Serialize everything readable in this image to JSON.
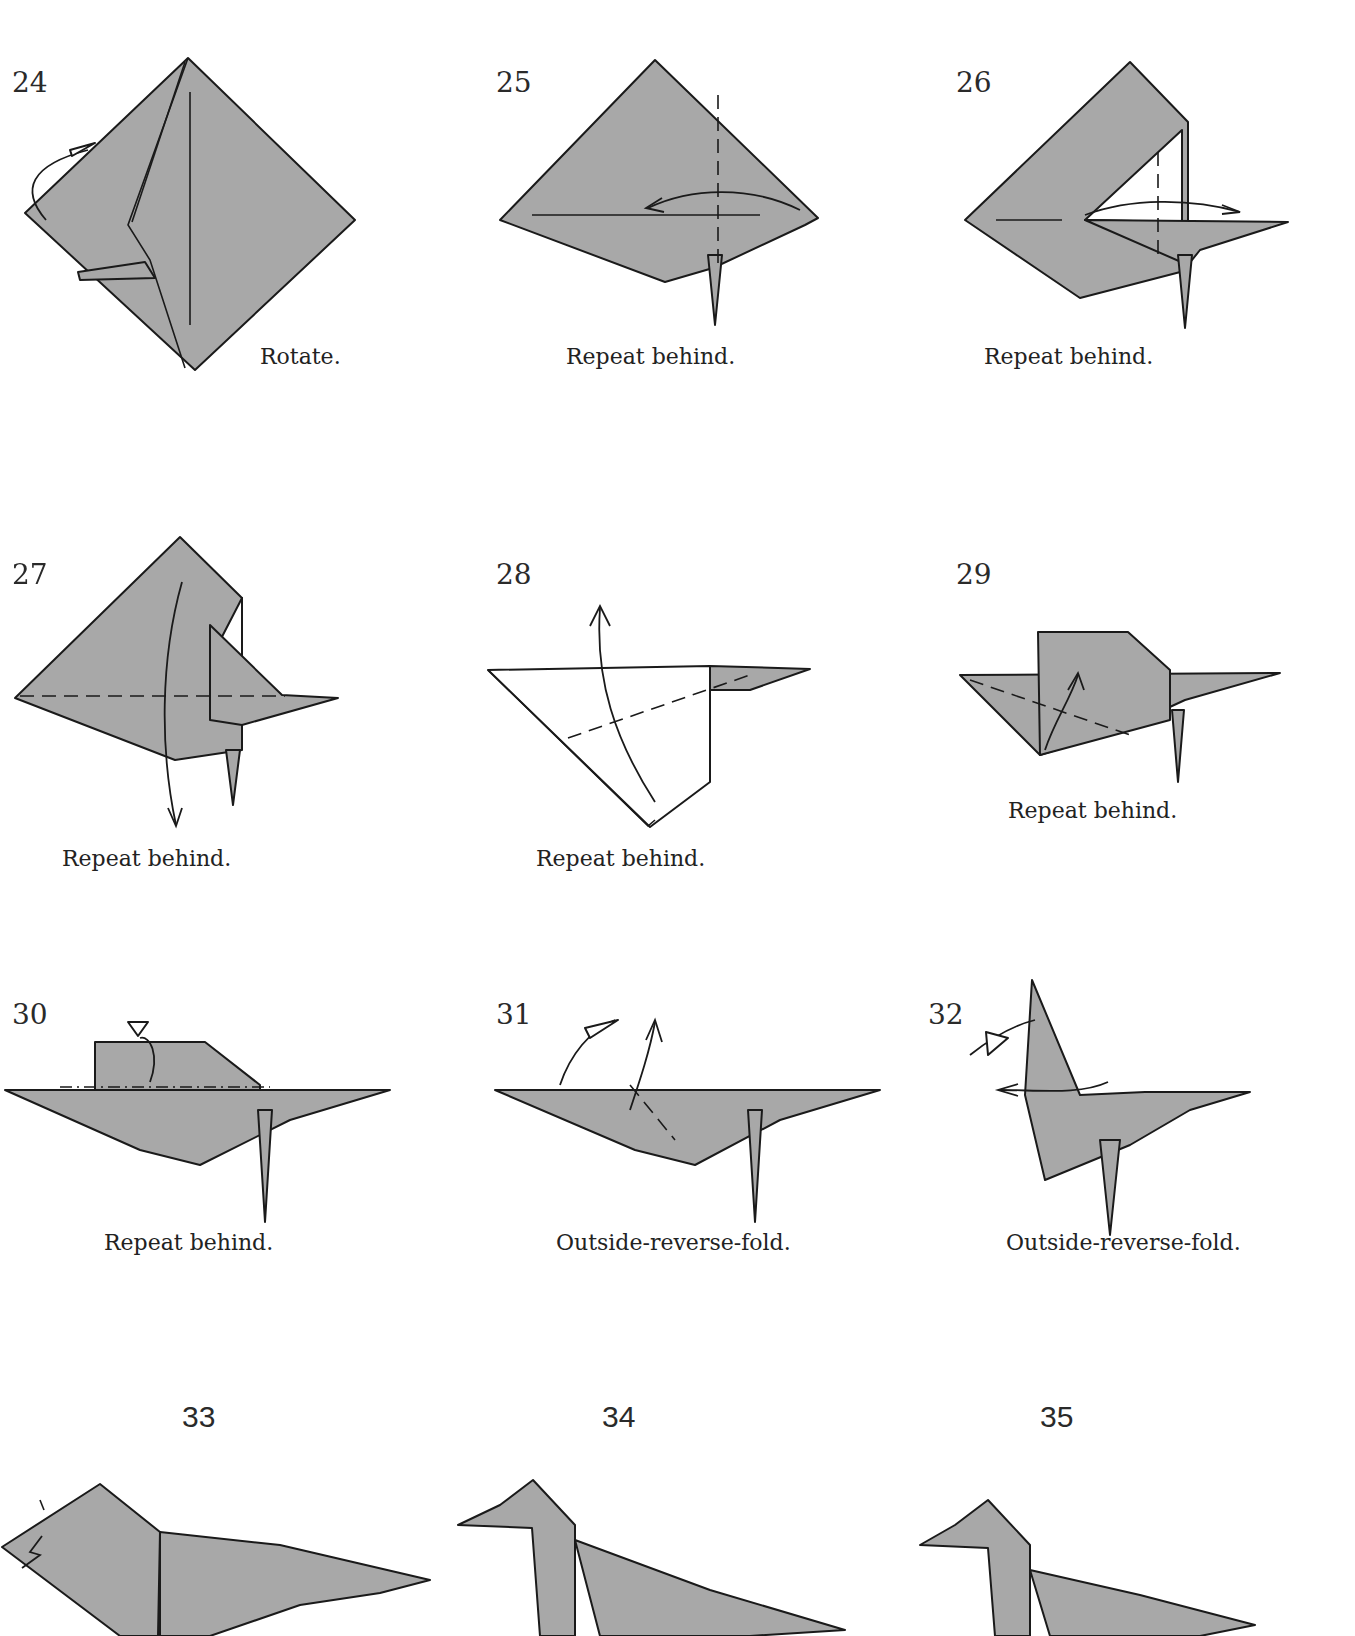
{
  "diagram": {
    "type": "origami folding instructions",
    "colors": {
      "paper": "#a8a8a8",
      "outline": "#1a1a1a",
      "background": "#ffffff"
    },
    "steps": [
      {
        "number": "24",
        "caption": "Rotate."
      },
      {
        "number": "25",
        "caption": "Repeat behind."
      },
      {
        "number": "26",
        "caption": "Repeat behind."
      },
      {
        "number": "27",
        "caption": "Repeat behind."
      },
      {
        "number": "28",
        "caption": "Repeat behind."
      },
      {
        "number": "29",
        "caption": "Repeat behind."
      },
      {
        "number": "30",
        "caption": "Repeat behind."
      },
      {
        "number": "31",
        "caption": "Outside-reverse-fold."
      },
      {
        "number": "32",
        "caption": "Outside-reverse-fold."
      },
      {
        "number": "33",
        "caption": ""
      },
      {
        "number": "34",
        "caption": ""
      },
      {
        "number": "35",
        "caption": ""
      }
    ]
  }
}
